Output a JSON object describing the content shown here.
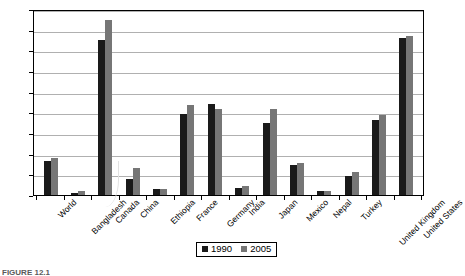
{
  "caption": "FIGURE 12.1",
  "legend": {
    "items": [
      {
        "label": "1990",
        "color": "#1a1a1a"
      },
      {
        "label": "2005",
        "color": "#767676"
      }
    ]
  },
  "chart_data": {
    "type": "bar",
    "title": "",
    "subtitle": "",
    "xlabel": "",
    "ylabel": "",
    "ylim": [
      0,
      9000
    ],
    "ytick_step": 1000,
    "yticks": [
      0,
      1000,
      2000,
      3000,
      4000,
      5000,
      6000,
      7000,
      8000,
      9000
    ],
    "ytick_labels": [
      "0",
      "1000",
      "2000",
      "3000",
      "4000",
      "5000",
      "6000",
      "7000",
      "8000",
      "9000"
    ],
    "grid": true,
    "grid_axis": "y",
    "legend_position": "bottom",
    "xtick_rotation": -45,
    "categories": [
      "World",
      "Bangladesh",
      "Canada",
      "China",
      "Ethiopia",
      "France",
      "Germany",
      "India",
      "Japan",
      "Mexico",
      "Nepal",
      "Turkey",
      "United Kingdom",
      "United States"
    ],
    "series": [
      {
        "name": "1990",
        "color": "#1a1a1a",
        "values": [
          1650,
          120,
          7500,
          760,
          290,
          3900,
          4420,
          330,
          3500,
          1450,
          180,
          900,
          3650,
          7600
        ]
      },
      {
        "name": "2005",
        "color": "#767676",
        "values": [
          1780,
          180,
          8450,
          1320,
          280,
          4350,
          4180,
          430,
          4150,
          1570,
          200,
          1100,
          3850,
          7700
        ]
      }
    ]
  }
}
